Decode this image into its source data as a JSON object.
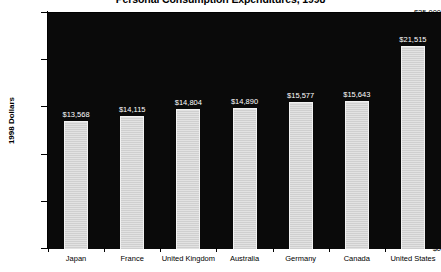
{
  "chart_data": {
    "type": "bar",
    "title": "Personal Consumption Expenditures, 1998",
    "xlabel": "",
    "ylabel": "1998 Dollars",
    "ylim": [
      0,
      25000
    ],
    "ytick_values": [
      0,
      5000,
      10000,
      15000,
      20000,
      25000
    ],
    "ytick_labels": [
      "$0",
      "$5,000",
      "$10,000",
      "$15,000",
      "$20,000",
      "$25,000"
    ],
    "grid": false,
    "legend": false,
    "plot_background": "#0a0a0a",
    "bar_color": "#d8d8d8",
    "label_color": "#ffffff",
    "categories": [
      "Japan",
      "France",
      "United Kingdom",
      "Australia",
      "Germany",
      "Canada",
      "United States"
    ],
    "values": [
      13568,
      14115,
      14804,
      14890,
      15577,
      15643,
      21515
    ],
    "value_labels": [
      "$13,568",
      "$14,115",
      "$14,804",
      "$14,890",
      "$15,577",
      "$15,643",
      "$21,515"
    ]
  },
  "bottom_caption": ""
}
